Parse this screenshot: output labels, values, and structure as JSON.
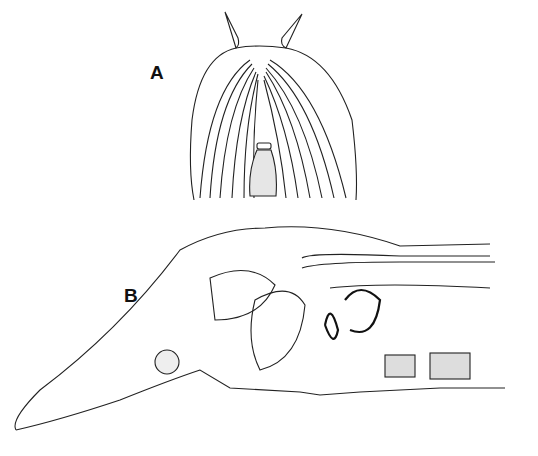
{
  "figure": {
    "panels": [
      {
        "id": "A",
        "label": "A",
        "description": "Dorsal view of anterior end with two tentacles and radiating lines"
      },
      {
        "id": "B",
        "label": "B",
        "description": "Longitudinal section of anterior body"
      }
    ]
  }
}
